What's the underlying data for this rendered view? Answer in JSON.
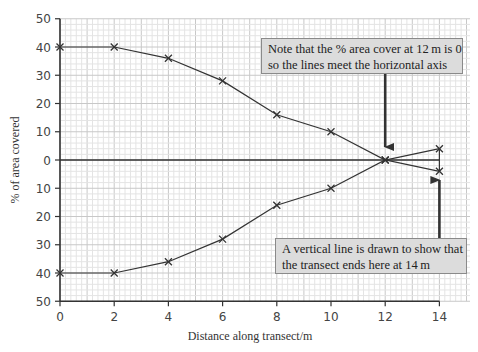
{
  "chart_data": {
    "type": "line",
    "title": "",
    "xlabel": "Distance along transect/m",
    "ylabel": "% of area covered",
    "x": [
      0,
      2,
      4,
      6,
      8,
      10,
      12,
      14
    ],
    "series": [
      {
        "name": "upper (mirrored kite diagram half)",
        "values": [
          40,
          40,
          36,
          28,
          16,
          10,
          0,
          4
        ]
      },
      {
        "name": "lower (mirrored kite diagram half)",
        "values": [
          -40,
          -40,
          -36,
          -28,
          -16,
          -10,
          0,
          -4
        ]
      }
    ],
    "x_ticks": [
      "0",
      "2",
      "4",
      "6",
      "8",
      "10",
      "12",
      "14"
    ],
    "y_ticks": [
      "50",
      "40",
      "30",
      "20",
      "10",
      "0",
      "10",
      "20",
      "30",
      "40",
      "50"
    ],
    "xlim": [
      0,
      14
    ],
    "ylim": [
      -50,
      50
    ],
    "grid": true,
    "marker": "x",
    "annotations": [
      {
        "text": "Note that the % area cover at 12 m is 0 so the lines meet the horizontal axis",
        "arrow_to": [
          12,
          0
        ]
      },
      {
        "text": "A vertical line is drawn to show that the transect ends here at 14 m",
        "arrow_to": [
          14,
          -4
        ]
      }
    ],
    "legend": "none"
  },
  "labels": {
    "xlabel": "Distance along transect/m",
    "ylabel": "% of area covered",
    "x_ticks": [
      "0",
      "2",
      "4",
      "6",
      "8",
      "10",
      "12",
      "14"
    ],
    "y_ticks": [
      "50",
      "40",
      "30",
      "20",
      "10",
      "0",
      "10",
      "20",
      "30",
      "40",
      "50"
    ]
  },
  "notes": {
    "top": {
      "line1": "Note that the % area cover at 12 m is 0",
      "line2": "so the lines meet the horizontal axis"
    },
    "bottom": {
      "line1": "A vertical line is drawn to show that",
      "line2": "the transect ends here at 14 m"
    }
  },
  "colors": {
    "grid_minor": "#e4e4e4",
    "grid_major": "#c8c8c8",
    "axis": "#333333",
    "line": "#333333",
    "note_bg": "#dcdcdc",
    "note_border": "#8a8a8a"
  }
}
